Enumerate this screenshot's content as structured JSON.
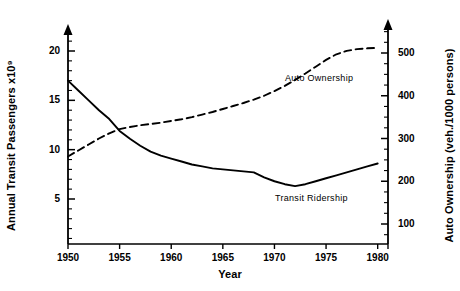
{
  "chart_data": {
    "type": "line",
    "title": "",
    "xlabel": "Year",
    "ylabel": "Annual Transit Passengers x10⁹",
    "ylabel_right": "Auto Ownership (veh./1000 persons)",
    "xlim": [
      1950,
      1981
    ],
    "ylim": [
      0,
      22
    ],
    "ylim_right": [
      0,
      550
    ],
    "grid": false,
    "legend_position": "inline-annotations",
    "x_ticks": [
      1950,
      1955,
      1960,
      1965,
      1970,
      1975,
      1980
    ],
    "x_tick_labels": [
      "1950",
      "1955",
      "1960",
      "1965",
      "1970",
      "1975",
      "1980"
    ],
    "y_ticks_left": [
      5,
      10,
      15,
      20
    ],
    "y_tick_labels_left": [
      "5",
      "10",
      "15",
      "20"
    ],
    "y_minor_step_left": 1,
    "y_ticks_right": [
      100,
      200,
      300,
      400,
      500
    ],
    "y_tick_labels_right": [
      "100",
      "200",
      "300",
      "400",
      "500"
    ],
    "y_minor_step_right": 25,
    "series": [
      {
        "name": "Transit Ridership",
        "axis": "left",
        "style": "solid",
        "color": "#000000",
        "x": [
          1950,
          1951,
          1952,
          1953,
          1954,
          1955,
          1956,
          1957,
          1958,
          1959,
          1960,
          1961,
          1962,
          1963,
          1964,
          1965,
          1966,
          1967,
          1968,
          1969,
          1970,
          1971,
          1972,
          1973,
          1974,
          1975,
          1976,
          1977,
          1978,
          1979,
          1980
        ],
        "y": [
          17.0,
          16.0,
          15.0,
          14.0,
          13.1,
          11.9,
          11.1,
          10.4,
          9.8,
          9.4,
          9.1,
          8.8,
          8.5,
          8.3,
          8.1,
          8.0,
          7.9,
          7.8,
          7.7,
          7.2,
          6.8,
          6.5,
          6.3,
          6.5,
          6.8,
          7.1,
          7.4,
          7.7,
          8.0,
          8.3,
          8.6
        ]
      },
      {
        "name": "Auto Ownership",
        "axis": "right",
        "style": "dashed",
        "color": "#000000",
        "x": [
          1950,
          1951,
          1952,
          1953,
          1954,
          1955,
          1956,
          1957,
          1958,
          1959,
          1960,
          1961,
          1962,
          1963,
          1964,
          1965,
          1966,
          1967,
          1968,
          1969,
          1970,
          1971,
          1972,
          1973,
          1974,
          1975,
          1976,
          1977,
          1978,
          1979,
          1980
        ],
        "y": [
          258,
          272,
          286,
          300,
          312,
          322,
          327,
          331,
          334,
          337,
          341,
          345,
          350,
          356,
          362,
          369,
          376,
          383,
          391,
          400,
          411,
          423,
          437,
          452,
          468,
          484,
          497,
          505,
          509,
          511,
          512
        ]
      }
    ],
    "annotations": [
      {
        "text": "Auto Ownership",
        "x_px": 285,
        "y_px": 73
      },
      {
        "text": "Transit Ridership",
        "x_px": 275,
        "y_px": 193
      }
    ]
  }
}
